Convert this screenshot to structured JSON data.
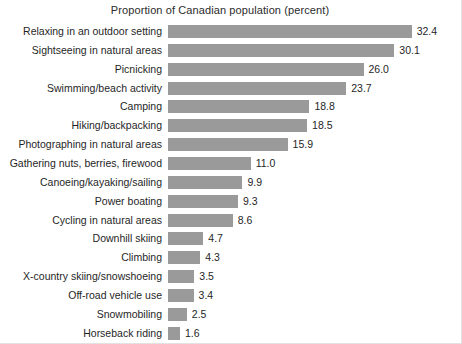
{
  "chart_data": {
    "type": "bar",
    "orientation": "horizontal",
    "title": "Proportion of Canadian population (percent)",
    "xlabel": "",
    "ylabel": "",
    "xlim": [
      0,
      35
    ],
    "grid": false,
    "legend": null,
    "value_labels": true,
    "bar_color": "#9a9a9a",
    "categories": [
      "Relaxing in an outdoor setting",
      "Sightseeing in natural areas",
      "Picnicking",
      "Swimming/beach activity",
      "Camping",
      "Hiking/backpacking",
      "Photographing in natural areas",
      "Gathering nuts, berries, firewood",
      "Canoeing/kayaking/sailing",
      "Power boating",
      "Cycling in natural areas",
      "Downhill skiing",
      "Climbing",
      "X-country skiing/snowshoeing",
      "Off-road vehicle use",
      "Snowmobiling",
      "Horseback riding"
    ],
    "values": [
      32.4,
      30.1,
      26.0,
      23.7,
      18.8,
      18.5,
      15.9,
      11.0,
      9.9,
      9.3,
      8.6,
      4.7,
      4.3,
      3.5,
      3.4,
      2.5,
      1.6
    ],
    "value_text": [
      "32.4",
      "30.1",
      "26.0",
      "23.7",
      "18.8",
      "18.5",
      "15.9",
      "11.0",
      "9.9",
      "9.3",
      "8.6",
      "4.7",
      "4.3",
      "3.5",
      "3.4",
      "2.5",
      "1.6"
    ]
  }
}
